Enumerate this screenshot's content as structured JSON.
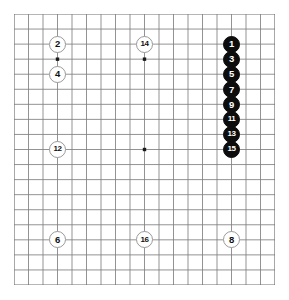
{
  "figure": {
    "kind": "go-board-diagram",
    "board_size": 19,
    "background_color": "#ffffff",
    "grid_line_color": "#808080",
    "grid_border_color": "#6e6e6e",
    "star_point_color": "#1a1a1a",
    "white_stone_fill": "#ffffff",
    "white_stone_border": "#9a9a9a",
    "white_stone_text": "#101010",
    "black_stone_fill": "#0d0d0d",
    "black_stone_text": "#ffffff"
  },
  "geometry": {
    "origin_x": 14,
    "origin_y": 14,
    "cell_width": 14.5,
    "cell_height": 15.05,
    "lines": 19
  },
  "star_points": [
    {
      "name": "hoshi-upper-left",
      "col": 3,
      "row": 3
    },
    {
      "name": "hoshi-upper-mid",
      "col": 9,
      "row": 3
    },
    {
      "name": "hoshi-upper-right",
      "col": 15,
      "row": 3
    },
    {
      "name": "hoshi-mid-left",
      "col": 3,
      "row": 9
    },
    {
      "name": "hoshi-center",
      "col": 9,
      "row": 9
    },
    {
      "name": "hoshi-mid-right",
      "col": 15,
      "row": 9
    },
    {
      "name": "hoshi-lower-left",
      "col": 3,
      "row": 15
    },
    {
      "name": "hoshi-lower-mid",
      "col": 9,
      "row": 15
    },
    {
      "name": "hoshi-lower-right",
      "col": 15,
      "row": 15
    }
  ],
  "stones": [
    {
      "label": "1",
      "color": "black",
      "col": 15,
      "row": 2
    },
    {
      "label": "3",
      "color": "black",
      "col": 15,
      "row": 3
    },
    {
      "label": "5",
      "color": "black",
      "col": 15,
      "row": 4
    },
    {
      "label": "7",
      "color": "black",
      "col": 15,
      "row": 5
    },
    {
      "label": "9",
      "color": "black",
      "col": 15,
      "row": 6
    },
    {
      "label": "11",
      "color": "black",
      "col": 15,
      "row": 7
    },
    {
      "label": "13",
      "color": "black",
      "col": 15,
      "row": 8
    },
    {
      "label": "15",
      "color": "black",
      "col": 15,
      "row": 9
    },
    {
      "label": "2",
      "color": "white",
      "col": 3,
      "row": 2
    },
    {
      "label": "4",
      "color": "white",
      "col": 3,
      "row": 4
    },
    {
      "label": "12",
      "color": "white",
      "col": 3,
      "row": 9
    },
    {
      "label": "6",
      "color": "white",
      "col": 3,
      "row": 15
    },
    {
      "label": "14",
      "color": "white",
      "col": 9,
      "row": 2
    },
    {
      "label": "16",
      "color": "white",
      "col": 9,
      "row": 15
    },
    {
      "label": "8",
      "color": "white",
      "col": 15,
      "row": 15
    }
  ]
}
